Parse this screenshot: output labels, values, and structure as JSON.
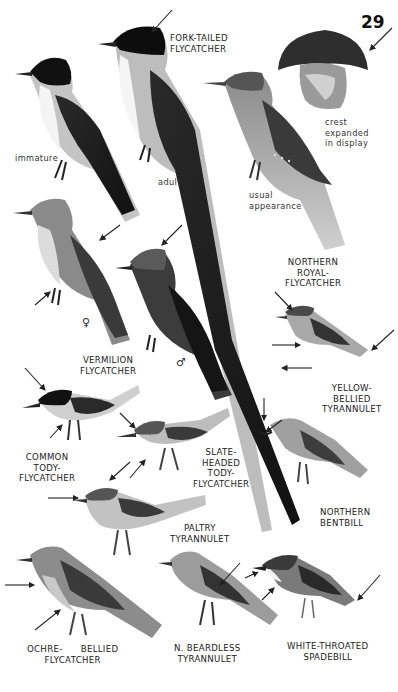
{
  "page": {
    "number": "29"
  },
  "species": [
    {
      "id": "fork-tailed-flycatcher",
      "name": "FORK-TAILED\nFLYCATCHER",
      "notes": [
        {
          "text": "immature"
        },
        {
          "text": "adult"
        }
      ]
    },
    {
      "id": "northern-royal-flycatcher",
      "name": "NORTHERN\nROYAL-\nFLYCATCHER",
      "notes": [
        {
          "text": "crest\nexpanded\nin display"
        },
        {
          "text": "usual\nappearance"
        }
      ]
    },
    {
      "id": "vermilion-flycatcher",
      "name": "VERMILION\nFLYCATCHER",
      "sex_symbols": [
        "♀",
        "♂"
      ]
    },
    {
      "id": "yellow-bellied-tyrannulet",
      "name": "YELLOW-\nBELLIED\nTYRANNULET"
    },
    {
      "id": "common-tody-flycatcher",
      "name": "COMMON\nTODY-\nFLYCATCHER"
    },
    {
      "id": "slate-headed-tody-flycatcher",
      "name": "SLATE-\nHEADED\nTODY-\nFLYCATCHER"
    },
    {
      "id": "northern-bentbill",
      "name": "NORTHERN\nBENTBILL"
    },
    {
      "id": "paltry-tyrannulet",
      "name": "PALTRY\nTYRANNULET"
    },
    {
      "id": "ochre-bellied-flycatcher",
      "name": "OCHRE-      BELLIED\nFLYCATCHER"
    },
    {
      "id": "n-beardless-tyrannulet",
      "name": "N. BEARDLESS\nTYRANNULET"
    },
    {
      "id": "white-throated-spadebill",
      "name": "WHITE-THROATED\nSPADEBILL"
    }
  ],
  "colors": {
    "background": "#ffffff",
    "ink": "#1a1a1a",
    "dark_plumage": "#1c1c1c",
    "mid_plumage": "#6e6e6e",
    "light_plumage": "#b9b9b9"
  }
}
